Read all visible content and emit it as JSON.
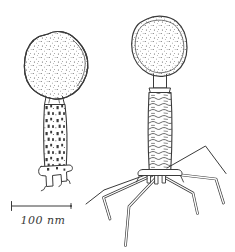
{
  "colors": {
    "background": "#ffffff",
    "ink": "#3a3a3a"
  },
  "illustration": {
    "scale_bar": {
      "label": "100 nm"
    }
  }
}
